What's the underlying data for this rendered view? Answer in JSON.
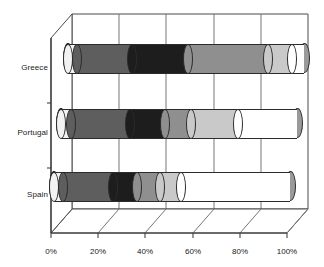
{
  "chart_data": {
    "type": "bar",
    "orientation": "horizontal",
    "stacked": true,
    "percent_stacked": true,
    "style": "3d-cylinder",
    "title": "",
    "subtitle": "",
    "xlabel": "",
    "ylabel": "",
    "grid": true,
    "legend": "none",
    "xlim": [
      0,
      100
    ],
    "xticks": [
      "0%",
      "20%",
      "40%",
      "60%",
      "80%",
      "100%"
    ],
    "xtick_values": [
      0,
      20,
      40,
      60,
      80,
      100
    ],
    "categories": [
      "Greece",
      "Portugal",
      "Spain"
    ],
    "series": [
      {
        "name": "Series 1",
        "color": "#f2f2f2",
        "values": [
          4,
          4,
          4
        ]
      },
      {
        "name": "Series 2",
        "color": "#5e5e5e",
        "values": [
          23,
          25,
          21
        ]
      },
      {
        "name": "Series 3",
        "color": "#1d1d1d",
        "values": [
          24,
          15,
          10
        ]
      },
      {
        "name": "Series 4",
        "color": "#8f8f8f",
        "values": [
          34,
          11,
          10
        ]
      },
      {
        "name": "Series 5",
        "color": "#c9c9c9",
        "values": [
          10,
          20,
          9
        ]
      },
      {
        "name": "Series 6",
        "color": "#ffffff",
        "values": [
          5,
          25,
          46
        ]
      }
    ],
    "end_cap_color": "#9a9a9a",
    "outline_color": "#2b2b2b"
  },
  "axis": {
    "y_labels": [
      "Greece",
      "Portugal",
      "Spain"
    ],
    "x_labels": [
      "0%",
      "20%",
      "40%",
      "60%",
      "80%",
      "100%"
    ]
  }
}
